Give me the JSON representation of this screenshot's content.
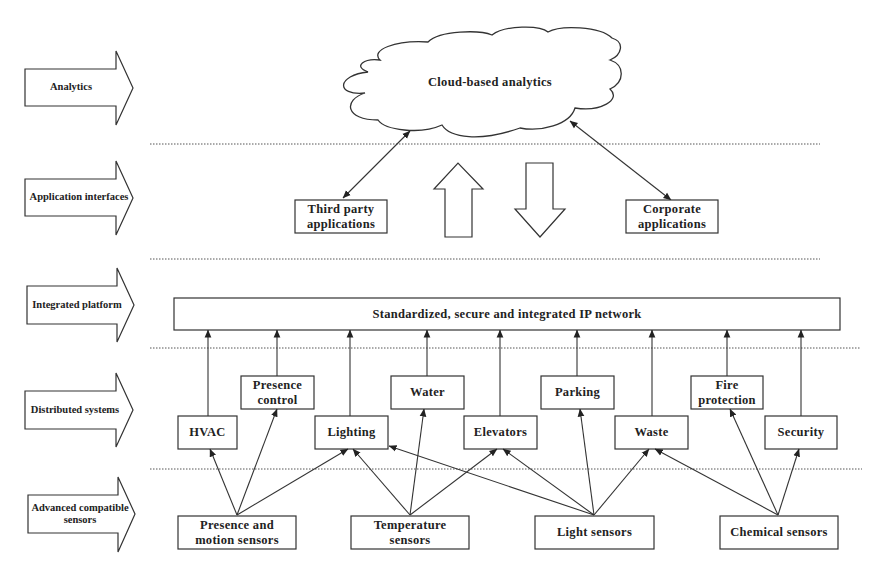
{
  "layers": [
    {
      "id": "analytics",
      "label": "Analytics"
    },
    {
      "id": "app-interfaces",
      "label": "Application interfaces"
    },
    {
      "id": "integrated-platform",
      "label": "Integrated platform"
    },
    {
      "id": "distributed-systems",
      "label": "Distributed systems"
    },
    {
      "id": "sensors",
      "label": "Advanced compatible sensors"
    }
  ],
  "cloud": {
    "label": "Cloud-based analytics"
  },
  "applications": {
    "third_party": "Third party applications",
    "corporate": "Corporate applications"
  },
  "network": {
    "label": "Standardized, secure and integrated IP network"
  },
  "systems": {
    "hvac": "HVAC",
    "presence_control": "Presence control",
    "lighting": "Lighting",
    "water": "Water",
    "elevators": "Elevators",
    "parking": "Parking",
    "waste": "Waste",
    "fire_protection": "Fire protection",
    "security": "Security"
  },
  "sensors": {
    "presence_motion": "Presence and motion sensors",
    "temperature": "Temperature sensors",
    "light": "Light sensors",
    "chemical": "Chemical sensors"
  },
  "connections": {
    "presence_motion": [
      "HVAC",
      "Presence control",
      "Lighting"
    ],
    "temperature": [
      "Lighting",
      "Water",
      "Elevators"
    ],
    "light": [
      "Lighting",
      "Elevators",
      "Parking",
      "Waste"
    ],
    "chemical": [
      "Waste",
      "Fire protection",
      "Security"
    ]
  },
  "colors": {
    "line": "#333333",
    "background": "#ffffff"
  }
}
